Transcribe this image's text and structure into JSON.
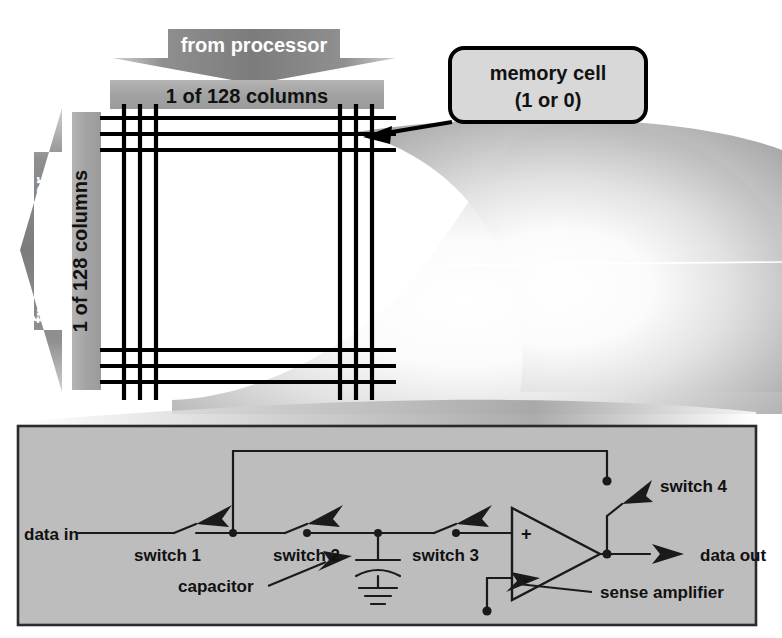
{
  "figure": {
    "colors": {
      "background": "#ffffff",
      "panel_fill": "#bdbdbd",
      "panel_border": "#2b2b2b",
      "bar_fill": "#a6a6a6",
      "arrow_fill": "#9a9a9a",
      "grid_line": "#000000",
      "wire": "#1a1a1a",
      "callout_fill": "#d8d8d8",
      "callout_border": "#000000",
      "swoosh_light": "#ffffff",
      "swoosh_dark": "#a8a8a8",
      "label_text": "#111111",
      "arrow_text": "#ffffff"
    }
  },
  "array": {
    "top_arrow_label": "from processor",
    "left_arrow_label": "from processor",
    "top_bar_label": "1 of 128 columns",
    "left_bar_label": "1 of 128 columns",
    "callout": {
      "line1": "memory cell",
      "line2": "(1 or 0)"
    }
  },
  "circuit": {
    "labels": {
      "data_in": "data in",
      "switch1": "switch 1",
      "switch2": "switch 2",
      "switch3": "switch 3",
      "switch4": "switch 4",
      "capacitor": "capacitor",
      "sense_amplifier": "sense amplifier",
      "data_out": "data out",
      "opamp_plus": "+",
      "opamp_minus": "-"
    }
  }
}
